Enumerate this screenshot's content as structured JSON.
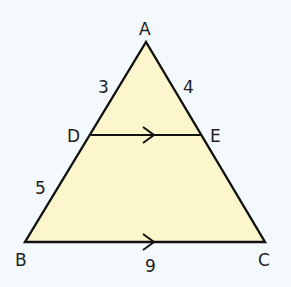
{
  "diagram": {
    "type": "triangle-proportionality",
    "background_color": "#f3f9fc",
    "fill_color": "#fbf6cc",
    "stroke_color": "#111111",
    "vertices": {
      "A": {
        "label": "A",
        "x": 146,
        "y": 42
      },
      "B": {
        "label": "B",
        "x": 25,
        "y": 242
      },
      "C": {
        "label": "C",
        "x": 265,
        "y": 242
      },
      "D": {
        "label": "D",
        "x": 91,
        "y": 135
      },
      "E": {
        "label": "E",
        "x": 202,
        "y": 135
      }
    },
    "segment_labels": {
      "AD": "3",
      "AE": "4",
      "DB": "5",
      "BC": "9"
    },
    "parallel_marks": [
      "DE",
      "BC"
    ]
  }
}
